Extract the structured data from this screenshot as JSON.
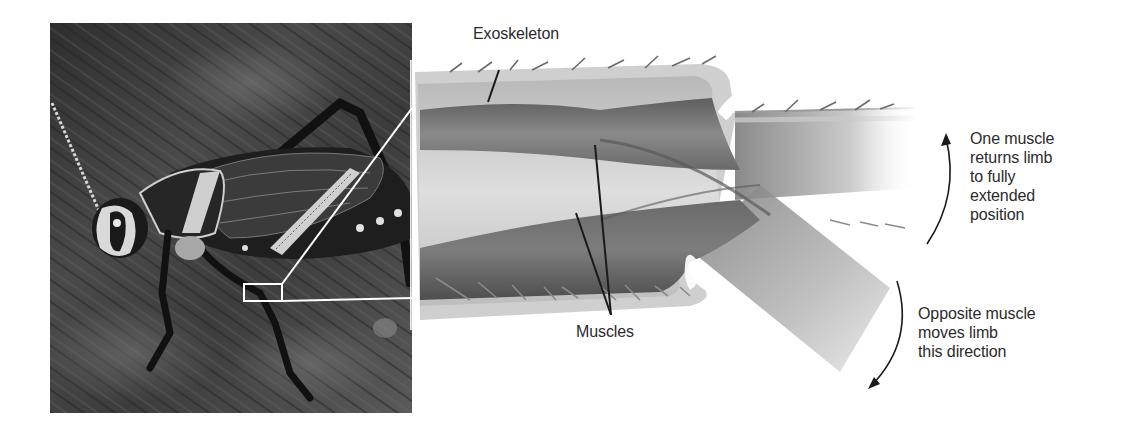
{
  "figure": {
    "type": "biology-diagram"
  },
  "photo": {
    "description": "grasshopper on bark",
    "callout_box": {
      "x": 244,
      "y": 284,
      "w": 38,
      "h": 17
    }
  },
  "labels": {
    "exoskeleton": "Exoskeleton",
    "muscles": "Muscles",
    "return_muscle": {
      "lines": [
        "One muscle",
        "returns limb",
        "to fully",
        "extended",
        "position"
      ]
    },
    "opposite_muscle": {
      "lines": [
        "Opposite muscle",
        "moves limb",
        "this direction"
      ]
    }
  },
  "arrows": {
    "extend": {
      "direction": "up",
      "meaning": "returns limb to fully extended position"
    },
    "flex": {
      "direction": "down",
      "meaning": "moves limb this direction"
    }
  },
  "colors": {
    "text": "#2b2b2b",
    "leader_line": "#1a1a1a",
    "callout_line": "#ffffff",
    "exoskeleton": "#c9c9c9",
    "muscle": "#6f6f6f",
    "background": "#ffffff"
  }
}
